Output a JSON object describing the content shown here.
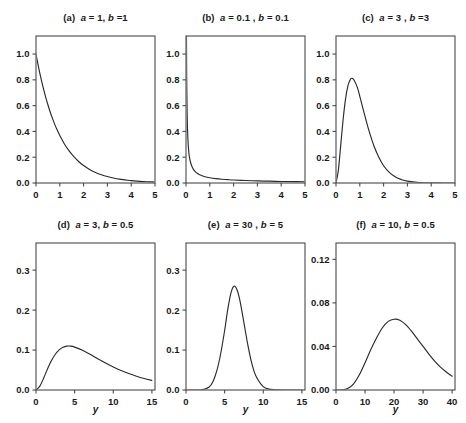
{
  "figure": {
    "background": "#ffffff",
    "line_color": "#2a2a2a",
    "axis_color": "#4a4a4a",
    "rows": 2,
    "cols": 3
  },
  "chart_data": [
    {
      "type": "line",
      "panel": "a",
      "title": "(a) a = 1, b =1",
      "title_parts": {
        "label": "(a)",
        "a_sym": "a",
        "a_eq": "= 1,",
        "b_sym": "b",
        "b_eq": "=1"
      },
      "params": {
        "a": 1,
        "b": 1
      },
      "xlabel": "",
      "ylabel": "",
      "xlim": [
        0,
        5
      ],
      "ylim": [
        0,
        1.14
      ],
      "xticks": [
        0,
        1,
        2,
        3,
        4,
        5
      ],
      "xtick_labels": [
        "0",
        "1",
        "2",
        "3",
        "4",
        "5"
      ],
      "yticks": [
        0.0,
        0.2,
        0.4,
        0.6,
        0.8,
        1.0
      ],
      "ytick_labels": [
        "0.0",
        "0.2",
        "0.4",
        "0.6",
        "0.8",
        "1.0"
      ],
      "grid": false,
      "legend": null,
      "x": [
        0,
        0.1,
        0.2,
        0.3,
        0.4,
        0.5,
        0.6,
        0.7,
        0.8,
        0.9,
        1.0,
        1.2,
        1.4,
        1.6,
        1.8,
        2.0,
        2.25,
        2.5,
        2.75,
        3.0,
        3.25,
        3.5,
        3.75,
        4.0,
        4.25,
        4.5,
        4.75,
        5.0
      ],
      "y": [
        1.0,
        0.905,
        0.819,
        0.741,
        0.67,
        0.607,
        0.549,
        0.497,
        0.449,
        0.407,
        0.368,
        0.301,
        0.247,
        0.202,
        0.165,
        0.135,
        0.105,
        0.082,
        0.064,
        0.05,
        0.039,
        0.03,
        0.024,
        0.018,
        0.014,
        0.011,
        0.009,
        0.007
      ]
    },
    {
      "type": "line",
      "panel": "b",
      "title": "(b)  a = 0.1 , b = 0.1",
      "title_parts": {
        "label": "(b)",
        "a_sym": "a",
        "a_eq": "= 0.1 ,",
        "b_sym": "b",
        "b_eq": "= 0.1"
      },
      "params": {
        "a": 0.1,
        "b": 0.1
      },
      "xlabel": "",
      "ylabel": "",
      "xlim": [
        0,
        5
      ],
      "ylim": [
        0,
        1.14
      ],
      "xticks": [
        0,
        1,
        2,
        3,
        4,
        5
      ],
      "xtick_labels": [
        "0",
        "1",
        "2",
        "3",
        "4",
        "5"
      ],
      "yticks": [
        0.0,
        0.2,
        0.4,
        0.6,
        0.8,
        1.0
      ],
      "ytick_labels": [
        "0.0",
        "0.2",
        "0.4",
        "0.6",
        "0.8",
        "1.0"
      ],
      "grid": false,
      "legend": null,
      "note": "curve is clipped at top of panel; rises steeply above 1.14 near x=0",
      "x": [
        0.02,
        0.03,
        0.05,
        0.08,
        0.12,
        0.16,
        0.2,
        0.25,
        0.3,
        0.4,
        0.5,
        0.6,
        0.8,
        1.0,
        1.25,
        1.5,
        1.75,
        2.0,
        2.5,
        3.0,
        3.5,
        4.0,
        4.5,
        5.0
      ],
      "y": [
        1.14,
        0.8,
        0.52,
        0.34,
        0.235,
        0.185,
        0.155,
        0.128,
        0.11,
        0.086,
        0.072,
        0.062,
        0.049,
        0.041,
        0.034,
        0.029,
        0.026,
        0.023,
        0.019,
        0.016,
        0.014,
        0.012,
        0.011,
        0.01
      ]
    },
    {
      "type": "line",
      "panel": "c",
      "title": "(c)  a = 3 , b =3",
      "title_parts": {
        "label": "(c)",
        "a_sym": "a",
        "a_eq": "= 3 ,",
        "b_sym": "b",
        "b_eq": "=3"
      },
      "params": {
        "a": 3,
        "b": 3
      },
      "xlabel": "",
      "ylabel": "",
      "xlim": [
        0,
        5
      ],
      "ylim": [
        0,
        1.14
      ],
      "xticks": [
        0,
        1,
        2,
        3,
        4,
        5
      ],
      "xtick_labels": [
        "0",
        "1",
        "2",
        "3",
        "4",
        "5"
      ],
      "yticks": [
        0.0,
        0.2,
        0.4,
        0.6,
        0.8,
        1.0
      ],
      "ytick_labels": [
        "0.0",
        "0.2",
        "0.4",
        "0.6",
        "0.8",
        "1.0"
      ],
      "grid": false,
      "legend": null,
      "peak": {
        "x": 0.667,
        "y": 0.812
      },
      "x": [
        0,
        0.1,
        0.2,
        0.3,
        0.4,
        0.5,
        0.6,
        0.667,
        0.75,
        0.9,
        1.0,
        1.2,
        1.4,
        1.6,
        1.8,
        2.0,
        2.25,
        2.5,
        2.75,
        3.0,
        3.5,
        4.0,
        4.5,
        5.0
      ],
      "y": [
        0.0,
        0.1,
        0.296,
        0.494,
        0.651,
        0.753,
        0.803,
        0.812,
        0.801,
        0.74,
        0.672,
        0.53,
        0.396,
        0.285,
        0.199,
        0.134,
        0.08,
        0.046,
        0.026,
        0.014,
        0.004,
        0.001,
        0.0003,
        0.0001
      ]
    },
    {
      "type": "line",
      "panel": "d",
      "title": "(d) a = 3, b = 0.5",
      "title_parts": {
        "label": "(d)",
        "a_sym": "a",
        "a_eq": "= 3,",
        "b_sym": "b",
        "b_eq": "= 0.5"
      },
      "params": {
        "a": 3,
        "b": 0.5
      },
      "xlabel": "y",
      "ylabel": "",
      "xlim": [
        0,
        15.4
      ],
      "ylim": [
        0,
        0.368
      ],
      "xticks": [
        0,
        5,
        10,
        15
      ],
      "xtick_labels": [
        "0",
        "5",
        "10",
        "15"
      ],
      "yticks": [
        0.0,
        0.1,
        0.2,
        0.3
      ],
      "ytick_labels": [
        "0.0",
        "0.1",
        "0.2",
        "0.3"
      ],
      "grid": false,
      "legend": null,
      "peak": {
        "x": 4.0,
        "y": 0.135
      },
      "x": [
        0,
        0.5,
        1.0,
        1.5,
        2.0,
        2.5,
        3.0,
        3.5,
        4.0,
        4.5,
        5.0,
        6.0,
        7.0,
        8.0,
        9.0,
        10.0,
        11.0,
        12.0,
        13.0,
        14.0,
        15.0
      ],
      "y": [
        0.0,
        0.0097,
        0.0303,
        0.0531,
        0.0736,
        0.0895,
        0.1004,
        0.107,
        0.1098,
        0.1097,
        0.1074,
        0.0996,
        0.0892,
        0.0782,
        0.0675,
        0.0578,
        0.049,
        0.0413,
        0.0346,
        0.0288,
        0.0239
      ]
    },
    {
      "type": "line",
      "panel": "e",
      "title": "(e)  a = 30 , b = 5",
      "title_parts": {
        "label": "(e)",
        "a_sym": "a",
        "a_eq": "= 30 ,",
        "b_sym": "b",
        "b_eq": "= 5"
      },
      "params": {
        "a": 30,
        "b": 5
      },
      "xlabel": "y",
      "ylabel": "",
      "xlim": [
        0,
        15.4
      ],
      "ylim": [
        0,
        0.368
      ],
      "xticks": [
        0,
        5,
        10,
        15
      ],
      "xtick_labels": [
        "0",
        "5",
        "10",
        "15"
      ],
      "yticks": [
        0.0,
        0.1,
        0.2,
        0.3
      ],
      "ytick_labels": [
        "0.0",
        "0.1",
        "0.2",
        "0.3"
      ],
      "grid": false,
      "legend": null,
      "peak": {
        "x": 5.8,
        "y": 0.362
      },
      "x": [
        0,
        2.0,
        3.0,
        3.5,
        4.0,
        4.5,
        5.0,
        5.4,
        5.8,
        6.2,
        6.6,
        7.0,
        7.5,
        8.0,
        8.5,
        9.0,
        10.0,
        11.0,
        12.0,
        13.0,
        15.0
      ],
      "y": [
        0.0,
        0.0003,
        0.0075,
        0.0215,
        0.049,
        0.092,
        0.149,
        0.201,
        0.242,
        0.26,
        0.251,
        0.222,
        0.168,
        0.113,
        0.068,
        0.037,
        0.0085,
        0.0016,
        0.0003,
        5e-05,
        0.0
      ]
    },
    {
      "type": "line",
      "panel": "f",
      "title": "(f) a = 10, b = 0.5",
      "title_parts": {
        "label": "(f)",
        "a_sym": "a",
        "a_eq": "= 10,",
        "b_sym": "b",
        "b_eq": "= 0.5"
      },
      "params": {
        "a": 10,
        "b": 0.5
      },
      "xlabel": "y",
      "ylabel": "",
      "xlim": [
        0,
        41
      ],
      "ylim": [
        0,
        0.135
      ],
      "xticks": [
        0,
        10,
        20,
        30,
        40
      ],
      "xtick_labels": [
        "0",
        "10",
        "20",
        "30",
        "40"
      ],
      "yticks": [
        0.0,
        0.04,
        0.08,
        0.12
      ],
      "ytick_labels": [
        "0.00",
        "0.04",
        "0.08",
        "0.12"
      ],
      "grid": false,
      "legend": null,
      "peak": {
        "x": 18.0,
        "y": 0.0657
      },
      "x": [
        0,
        2,
        4,
        6,
        8,
        10,
        12,
        14,
        16,
        18,
        20,
        22,
        24,
        26,
        28,
        30,
        32,
        34,
        36,
        38,
        40
      ],
      "y": [
        0.0,
        0.0001,
        0.0013,
        0.0055,
        0.0138,
        0.025,
        0.0372,
        0.048,
        0.0572,
        0.063,
        0.065,
        0.064,
        0.06,
        0.054,
        0.047,
        0.04,
        0.033,
        0.0265,
        0.021,
        0.0165,
        0.0127
      ]
    }
  ]
}
